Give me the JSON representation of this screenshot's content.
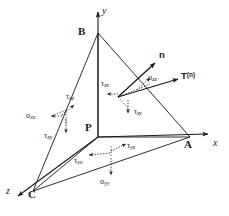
{
  "figure": {
    "axes": [
      {
        "name": "y-axis",
        "label": "y",
        "tip": [
          98,
          8
        ]
      },
      {
        "name": "x-axis",
        "label": "x",
        "tip": [
          212,
          133
        ]
      },
      {
        "name": "z-axis",
        "label": "z",
        "tip": [
          14,
          198
        ]
      }
    ],
    "vertices": [
      {
        "name": "P",
        "label": "P",
        "pos": [
          98,
          137
        ]
      },
      {
        "name": "A",
        "label": "A",
        "pos": [
          190,
          137
        ]
      },
      {
        "name": "B",
        "label": "B",
        "pos": [
          98,
          33
        ]
      },
      {
        "name": "C",
        "label": "C",
        "pos": [
          33,
          191
        ]
      }
    ],
    "vectors": [
      {
        "name": "normal",
        "label": "n"
      },
      {
        "name": "traction",
        "label": "T",
        "superscript": "(n)"
      }
    ],
    "stress_components": [
      {
        "name": "tau-xz",
        "sym": "τ",
        "sub": "xz"
      },
      {
        "name": "sigma-xx",
        "sym": "σ",
        "sub": "xx"
      },
      {
        "name": "tau-xy",
        "sym": "τ",
        "sub": "xy"
      },
      {
        "name": "tau-zx",
        "sym": "τ",
        "sub": "zx"
      },
      {
        "name": "sigma-zz",
        "sym": "σ",
        "sub": "zz"
      },
      {
        "name": "tau-zy",
        "sym": "τ",
        "sub": "zy"
      },
      {
        "name": "tau-yz",
        "sym": "τ",
        "sub": "yz"
      },
      {
        "name": "tau-yx",
        "sym": "τ",
        "sub": "yx"
      },
      {
        "name": "sigma-yy",
        "sym": "σ",
        "sub": "yy"
      }
    ],
    "labels": {
      "y": "y",
      "x": "x",
      "z": "z",
      "P": "P",
      "A": "A",
      "B": "B",
      "C": "C",
      "n": "n",
      "T": "T",
      "Tsup": "(n)",
      "tau": "τ",
      "sigma": "σ",
      "xz": "xz",
      "xx": "xx",
      "xy": "xy",
      "zx": "zx",
      "zz": "zz",
      "zy": "zy",
      "yz": "yz",
      "yx": "yx",
      "yy": "yy"
    },
    "colors": {
      "stroke": "#1a1a1a",
      "background": "#ffffff"
    }
  }
}
